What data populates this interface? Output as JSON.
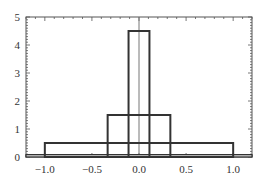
{
  "chart_data": {
    "type": "bar",
    "subtype": "overlapping-outline-histograms",
    "title": "",
    "xlabel": "",
    "ylabel": "",
    "xlim": [
      -1.2,
      1.2
    ],
    "ylim": [
      0,
      5
    ],
    "grid": false,
    "legend": null,
    "x_ticks": [
      "-1.0",
      "-0.5",
      "0.0",
      "0.5",
      "1.0"
    ],
    "y_ticks": [
      "0",
      "1",
      "2",
      "3",
      "4",
      "5"
    ],
    "series": [
      {
        "name": "wide",
        "x_start": -1.0,
        "x_end": 1.0,
        "height": 0.5
      },
      {
        "name": "medium",
        "x_start": -0.333,
        "x_end": 0.333,
        "height": 1.5
      },
      {
        "name": "narrow",
        "x_start": -0.111,
        "x_end": 0.111,
        "height": 4.5
      }
    ],
    "baseline_band": {
      "x_start": -1.2,
      "x_end": 1.2,
      "height": 0.05
    },
    "reference_line_x": 0.0,
    "colors": {
      "bar_stroke": "#333333",
      "axis": "#555555",
      "ref_line": "#777777"
    }
  }
}
